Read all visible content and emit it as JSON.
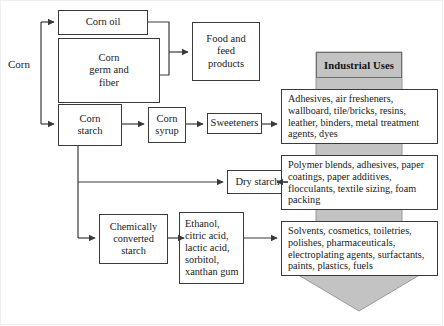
{
  "diagram": {
    "colors": {
      "arrow_fill": "#c3c3c3",
      "arrow_stroke": "#8a8a8a",
      "box_border": "#3a3a3a",
      "box_fill": "#ffffff",
      "line": "#3a3a3a",
      "text": "#1a1a1a"
    },
    "source_label": "Corn",
    "banner_label": "Industrial Uses",
    "nodes": {
      "corn_oil": "Corn oil",
      "corn_germ_and_fiber": "Corn\ngerm and\nfiber",
      "food_and_feed_products": "Food and\nfeed\nproducts",
      "corn_starch": "Corn\nstarch",
      "corn_syrup": "Corn\nsyrup",
      "sweeteners": "Sweeteners",
      "dry_starch": "Dry starch",
      "chemically_converted_starch": "Chemically\nconverted\nstarch",
      "ethanol_products": "Ethanol,\ncitric acid,\nlactic acid,\nsorbitol,\nxanthan gum",
      "uses_sweeteners": "Adhesives, air fresheners, wallboard, tile/bricks, resins, leather, binders, metal treatment agents, dyes",
      "uses_dry_starch": "Polymer blends, adhesives, paper coatings, paper additives, flocculants, textile sizing, foam packing",
      "uses_chemical": "Solvents, cosmetics, toiletries, polishes, pharmaceuticals, electroplating agents, surfactants, paints, plastics, fuels"
    }
  }
}
